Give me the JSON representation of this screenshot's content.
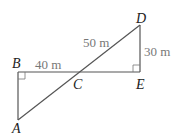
{
  "diagram": {
    "points": {
      "A": {
        "label": "A",
        "x": 18,
        "y": 120
      },
      "B": {
        "label": "B",
        "x": 18,
        "y": 72
      },
      "C": {
        "label": "C",
        "x": 78,
        "y": 72
      },
      "D": {
        "label": "D",
        "x": 140,
        "y": 25
      },
      "E": {
        "label": "E",
        "x": 140,
        "y": 72
      }
    },
    "lengths": {
      "BC": "40 m",
      "CD": "50 m",
      "DE": "30 m"
    },
    "right_angles": [
      "B",
      "E"
    ]
  }
}
